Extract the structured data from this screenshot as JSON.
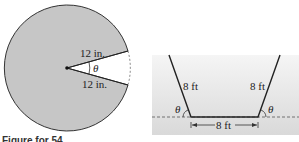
{
  "figure_left": {
    "name": "circle-with-sector-removed",
    "radius_label_top": "12 in.",
    "radius_label_bottom": "12 in.",
    "angle_label": "θ",
    "fill_color": "#c6c6c6",
    "stroke_color": "#333333"
  },
  "figure_right": {
    "name": "trough-cross-section",
    "left_side_label": "8 ft",
    "right_side_label": "8 ft",
    "bottom_label": "8 ft",
    "left_angle_label": "θ",
    "right_angle_label": "θ",
    "background_top": "#f4f4f4",
    "background_bottom": "#dcdcdc"
  },
  "caption": {
    "text": "Figure for 54"
  }
}
